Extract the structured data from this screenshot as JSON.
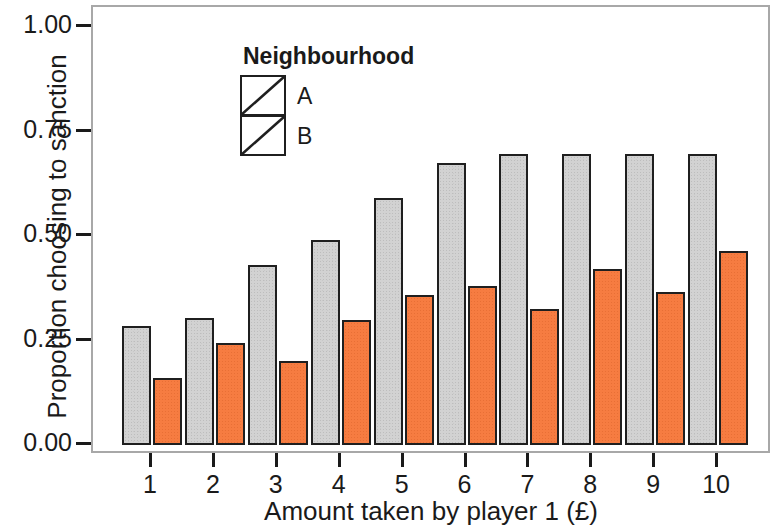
{
  "chart_data": {
    "type": "bar",
    "title": "",
    "xlabel": "Amount taken by player 1 (£)",
    "ylabel": "Proportion choosing to sanction",
    "categories": [
      "1",
      "2",
      "3",
      "4",
      "5",
      "6",
      "7",
      "8",
      "9",
      "10"
    ],
    "ylim": [
      0.0,
      1.0
    ],
    "yticks": [
      "0.00",
      "0.25",
      "0.50",
      "0.75",
      "1.00"
    ],
    "ytick_values": [
      0.0,
      0.25,
      0.5,
      0.75,
      1.0
    ],
    "grid": false,
    "legend_position": "inside-top-left",
    "legend_title": "Neighbourhood",
    "series": [
      {
        "name": "A",
        "color": "#d2d2d2",
        "values": [
          0.285,
          0.305,
          0.43,
          0.49,
          0.59,
          0.675,
          0.695,
          0.695,
          0.695,
          0.695
        ]
      },
      {
        "name": "B",
        "color": "#f67c41",
        "values": [
          0.16,
          0.245,
          0.2,
          0.3,
          0.36,
          0.38,
          0.325,
          0.42,
          0.365,
          0.465
        ]
      }
    ]
  },
  "axis": {
    "y_title": "Proportion choosing to sanction",
    "x_title": "Amount taken by player 1 (£)"
  },
  "legend": {
    "title": "Neighbourhood",
    "items": [
      {
        "label": "A",
        "color": "#d2d2d2"
      },
      {
        "label": "B",
        "color": "#f67c41"
      }
    ]
  }
}
